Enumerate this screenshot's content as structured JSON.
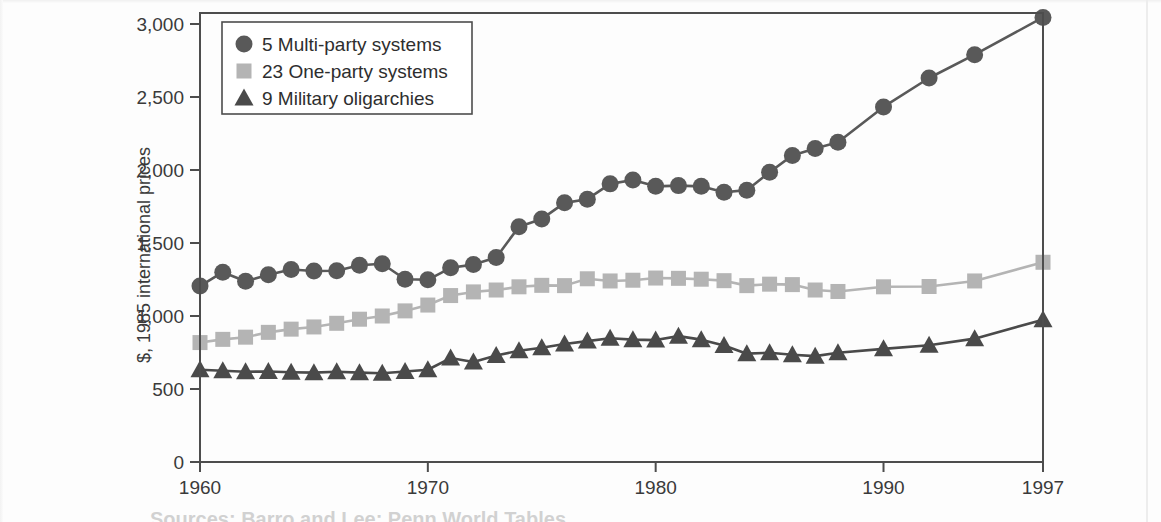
{
  "figure": {
    "background_color": "#fdfdfd",
    "frame_color": "#4d4d4d",
    "partial_caption": "Sources: Barro and Lee; Penn World Tables"
  },
  "axes": {
    "y_title": "$, 1985 international prices",
    "y_ticks": [
      "0",
      "500",
      "1,000",
      "1,500",
      "2,000",
      "2,500",
      "3,000"
    ],
    "x_ticks": [
      "1960",
      "1970",
      "1980",
      "1990",
      "1997"
    ]
  },
  "legend": {
    "items": [
      {
        "label": "5 Multi-party systems",
        "marker": "circle-marker",
        "color": "#595959"
      },
      {
        "label": "23 One-party systems",
        "marker": "square-marker",
        "color": "#b4b4b4"
      },
      {
        "label": "9 Military oligarchies",
        "marker": "triangle-marker",
        "color": "#4a4a4a"
      }
    ]
  },
  "chart_data": {
    "type": "line",
    "title": "",
    "xlabel": "",
    "ylabel": "$, 1985 international prices",
    "xlim": [
      1960,
      1997
    ],
    "ylim": [
      0,
      3100
    ],
    "grid": false,
    "legend_position": "top-left",
    "x": [
      1960,
      1961,
      1962,
      1963,
      1964,
      1965,
      1966,
      1967,
      1968,
      1969,
      1970,
      1971,
      1972,
      1973,
      1974,
      1975,
      1976,
      1977,
      1978,
      1979,
      1980,
      1981,
      1982,
      1983,
      1984,
      1985,
      1986,
      1987,
      1988,
      1990,
      1992,
      1994,
      1997
    ],
    "series": [
      {
        "name": "5 Multi-party systems",
        "marker": "circle",
        "color": "#595959",
        "values": [
          1205,
          1300,
          1238,
          1282,
          1318,
          1308,
          1310,
          1348,
          1358,
          1252,
          1248,
          1330,
          1352,
          1400,
          1612,
          1665,
          1775,
          1800,
          1905,
          1932,
          1888,
          1893,
          1888,
          1848,
          1862,
          1985,
          2100,
          2148,
          2190,
          2432,
          2630,
          2790,
          3045
        ]
      },
      {
        "name": "23 One-party systems",
        "marker": "square",
        "color": "#b4b4b4",
        "values": [
          818,
          840,
          855,
          888,
          910,
          925,
          950,
          978,
          1000,
          1035,
          1075,
          1140,
          1165,
          1178,
          1200,
          1210,
          1208,
          1255,
          1240,
          1245,
          1260,
          1258,
          1252,
          1242,
          1208,
          1218,
          1215,
          1178,
          1168,
          1200,
          1202,
          1240,
          1368
        ]
      },
      {
        "name": "9 Military oligarchies",
        "marker": "triangle",
        "color": "#4a4a4a",
        "values": [
          632,
          625,
          618,
          620,
          615,
          612,
          618,
          612,
          608,
          620,
          632,
          712,
          685,
          730,
          762,
          782,
          808,
          828,
          848,
          838,
          835,
          862,
          838,
          798,
          742,
          748,
          735,
          725,
          748,
          775,
          800,
          845,
          975
        ]
      }
    ]
  }
}
